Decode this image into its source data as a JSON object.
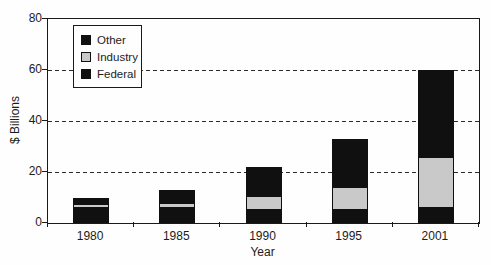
{
  "chart_data": {
    "type": "bar",
    "stacked": true,
    "title": "",
    "xlabel": "Year",
    "ylabel": "$ Billions",
    "categories": [
      "1980",
      "1985",
      "1990",
      "1995",
      "2001"
    ],
    "series": [
      {
        "name": "Federal",
        "color": "#101010",
        "values": [
          6,
          6,
          5,
          5,
          6
        ]
      },
      {
        "name": "Industry",
        "color": "#c9c9c9",
        "values": [
          1.5,
          2,
          5.5,
          9,
          20
        ]
      },
      {
        "name": "Other",
        "color": "#101010",
        "values": [
          2.5,
          5,
          11.5,
          19,
          34
        ]
      }
    ],
    "totals": [
      10,
      13,
      22,
      33,
      60
    ],
    "ylim": [
      0,
      80
    ],
    "yticks": [
      0,
      20,
      40,
      60,
      80
    ],
    "gridlines": [
      20,
      40,
      60
    ],
    "grid_style": "dashed",
    "plot_frame": true,
    "legend_position": "top-left"
  },
  "legend": {
    "items": [
      {
        "label": "Other",
        "color": "#101010"
      },
      {
        "label": "Industry",
        "color": "#c9c9c9"
      },
      {
        "label": "Federal",
        "color": "#101010"
      }
    ]
  },
  "axes": {
    "x_tick_labels": [
      "1980",
      "1985",
      "1990",
      "1995",
      "2001"
    ],
    "y_tick_labels": [
      "0",
      "20",
      "40",
      "60",
      "80"
    ]
  },
  "colors": {
    "ink": "#1a1a1a",
    "background": "#fefefe"
  }
}
